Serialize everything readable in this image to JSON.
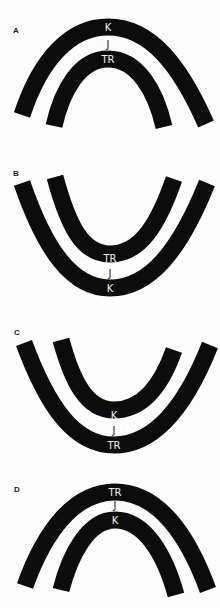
{
  "panels": [
    {
      "label": "A",
      "orientation": "arch",
      "outer_band_label": "K",
      "gap_label": "J",
      "inner_band_label": "TR"
    },
    {
      "label": "B",
      "orientation": "bowl",
      "outer_band_label": "K",
      "gap_label": "J",
      "inner_band_label": "TR"
    },
    {
      "label": "C",
      "orientation": "bowl",
      "outer_band_label": "TR",
      "gap_label": "J",
      "inner_band_label": "K"
    },
    {
      "label": "D",
      "orientation": "arch",
      "outer_band_label": "TR",
      "gap_label": "J",
      "inner_band_label": "K"
    }
  ],
  "colors": {
    "band": "#0c0c0c",
    "background": "#fdfdfd",
    "label_on_band": "#f2f2f2"
  }
}
